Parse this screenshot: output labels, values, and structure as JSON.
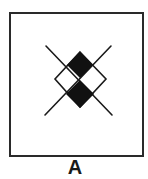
{
  "figure": {
    "label": "A",
    "colors": {
      "stroke": "#1a1a1a",
      "fill": "#111111",
      "border": "#2a2a2a",
      "background": "#ffffff"
    },
    "elements": [
      {
        "type": "line",
        "from": [
          46,
          46
        ],
        "to": [
          112,
          115
        ]
      },
      {
        "type": "line",
        "from": [
          111,
          46
        ],
        "to": [
          45,
          115
        ]
      },
      {
        "type": "diamond-outline",
        "points": [
          [
            80,
            52
          ],
          [
            106,
            79
          ],
          [
            80,
            108
          ],
          [
            55,
            79
          ]
        ]
      },
      {
        "type": "diamond-filled",
        "points": [
          [
            80,
            52
          ],
          [
            93,
            65
          ],
          [
            80,
            78
          ],
          [
            67,
            65
          ]
        ]
      },
      {
        "type": "diamond-filled",
        "points": [
          [
            80,
            80
          ],
          [
            93,
            94
          ],
          [
            80,
            108
          ],
          [
            67,
            94
          ]
        ]
      }
    ]
  }
}
